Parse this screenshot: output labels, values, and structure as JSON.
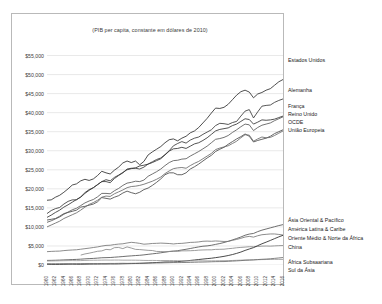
{
  "chart_data": {
    "type": "line",
    "title": "(PIB per capita, constante em dólares de 2010)",
    "xlabel": "",
    "ylabel": "",
    "ylim": [
      0,
      57500
    ],
    "xlim": [
      1960,
      2016
    ],
    "grid": true,
    "legend_position": "right-inline",
    "y_ticks": [
      {
        "value": 55000,
        "label": "$55,000"
      },
      {
        "value": 50000,
        "label": "$50,000"
      },
      {
        "value": 45000,
        "label": "$45,000"
      },
      {
        "value": 40000,
        "label": "$40,000"
      },
      {
        "value": 35000,
        "label": "$35,000"
      },
      {
        "value": 30000,
        "label": "$30,000"
      },
      {
        "value": 25000,
        "label": "$25,000"
      },
      {
        "value": 20000,
        "label": "$20,000"
      },
      {
        "value": 15000,
        "label": "$15,000"
      },
      {
        "value": 10000,
        "label": "$10,000"
      },
      {
        "value": 5000,
        "label": "$5,000"
      },
      {
        "value": 0,
        "label": "$0"
      }
    ],
    "x_ticks": [
      "1960",
      "1962",
      "1964",
      "1966",
      "1968",
      "1970",
      "1972",
      "1974",
      "1976",
      "1978",
      "1980",
      "1982",
      "1984",
      "1986",
      "1988",
      "1990",
      "1992",
      "1994",
      "1996",
      "1998",
      "2000",
      "2002",
      "2004",
      "2006",
      "2008",
      "2010",
      "2012",
      "2014",
      "2016"
    ],
    "x": [
      1960,
      1961,
      1962,
      1963,
      1964,
      1965,
      1966,
      1967,
      1968,
      1969,
      1970,
      1971,
      1972,
      1973,
      1974,
      1975,
      1976,
      1977,
      1978,
      1979,
      1980,
      1981,
      1982,
      1983,
      1984,
      1985,
      1986,
      1987,
      1988,
      1989,
      1990,
      1991,
      1992,
      1993,
      1994,
      1995,
      1996,
      1997,
      1998,
      1999,
      2000,
      2001,
      2002,
      2003,
      2004,
      2005,
      2006,
      2007,
      2008,
      2009,
      2010,
      2011,
      2012,
      2013,
      2014,
      2015,
      2016
    ],
    "series": [
      {
        "name": "Estados Unidos",
        "label": "Estados Unidos",
        "color": "#2f2f2f",
        "values": [
          17000,
          17100,
          17800,
          18300,
          19100,
          20000,
          21000,
          21300,
          22100,
          22500,
          22200,
          22600,
          23500,
          24600,
          24200,
          23900,
          24900,
          25700,
          26800,
          27300,
          26900,
          27300,
          26300,
          27200,
          28900,
          29700,
          30400,
          31100,
          32100,
          32900,
          33100,
          32600,
          33300,
          33800,
          34700,
          35200,
          36100,
          37300,
          38500,
          39900,
          41200,
          41100,
          41400,
          42200,
          43400,
          44600,
          45500,
          45900,
          45400,
          43900,
          44900,
          45300,
          45900,
          46300,
          47200,
          48100,
          48700
        ]
      },
      {
        "name": "Alemanha",
        "label": "Alemanha",
        "color": "#3a3a3a",
        "values": [
          13500,
          14300,
          14800,
          15100,
          16000,
          16700,
          17100,
          17100,
          17900,
          19000,
          19800,
          20300,
          21100,
          21900,
          21900,
          21600,
          22700,
          23500,
          24200,
          25200,
          25400,
          25400,
          25200,
          25700,
          26500,
          27100,
          27700,
          28100,
          29000,
          30000,
          31300,
          31900,
          32400,
          32000,
          32800,
          33300,
          33600,
          34300,
          34900,
          35500,
          36600,
          37200,
          37100,
          36900,
          37400,
          37700,
          39100,
          40400,
          40800,
          38600,
          40200,
          41700,
          41900,
          42000,
          42700,
          43200,
          43600
        ]
      },
      {
        "name": "França",
        "label": "França",
        "color": "#343434",
        "values": [
          12500,
          13100,
          13800,
          14400,
          15200,
          15800,
          16500,
          17200,
          17800,
          18800,
          19600,
          20300,
          21100,
          21900,
          22400,
          22100,
          23000,
          23600,
          24300,
          25000,
          25300,
          25500,
          26000,
          26200,
          26500,
          26900,
          27400,
          27900,
          28900,
          29900,
          30500,
          30600,
          30900,
          30600,
          31200,
          31800,
          32100,
          32700,
          33400,
          34300,
          35200,
          35600,
          35800,
          36000,
          36600,
          37000,
          37700,
          38400,
          38200,
          37000,
          37500,
          38100,
          38000,
          38100,
          38300,
          38700,
          39100
        ]
      },
      {
        "name": "Reino Unido",
        "label": "Reino Unido",
        "color": "#4a4a4a",
        "values": [
          11800,
          12000,
          12200,
          12800,
          13500,
          13800,
          14100,
          14400,
          15200,
          15400,
          15700,
          16000,
          16600,
          17700,
          17500,
          17300,
          17800,
          18200,
          18900,
          19400,
          19000,
          18700,
          19100,
          19800,
          20200,
          20900,
          21700,
          22600,
          23700,
          24200,
          24200,
          23700,
          23700,
          24200,
          25200,
          25800,
          26500,
          27300,
          28100,
          28800,
          29800,
          30400,
          30900,
          31700,
          32400,
          33100,
          33700,
          34400,
          33800,
          32300,
          32700,
          33000,
          33300,
          33800,
          34500,
          35000,
          35500
        ]
      },
      {
        "name": "OCDE",
        "label": "OCDE",
        "color": "#5a5a5a",
        "values": [
          11200,
          11600,
          12100,
          12600,
          13300,
          13900,
          14500,
          14900,
          15600,
          16300,
          16800,
          17200,
          17900,
          18800,
          18800,
          18700,
          19500,
          20100,
          20900,
          21500,
          21700,
          22000,
          21900,
          22300,
          23300,
          23900,
          24500,
          25200,
          26100,
          26900,
          27400,
          27500,
          27800,
          27900,
          28600,
          29200,
          29800,
          30500,
          31200,
          32100,
          33000,
          33200,
          33500,
          34000,
          34800,
          35500,
          36300,
          37000,
          36800,
          35300,
          36100,
          36700,
          37000,
          37300,
          37900,
          38400,
          38900
        ]
      },
      {
        "name": "União Europeia",
        "label": "União Europeia",
        "color": "#6a6a6a",
        "values": [
          10000,
          10500,
          11000,
          11500,
          12200,
          12700,
          13200,
          13700,
          14400,
          15200,
          15900,
          16400,
          17000,
          17800,
          18100,
          18000,
          18700,
          19200,
          19700,
          20300,
          20600,
          20700,
          20900,
          21200,
          21600,
          22000,
          22500,
          23100,
          24000,
          24700,
          25300,
          25500,
          25600,
          25400,
          26100,
          26700,
          27200,
          27900,
          28600,
          29300,
          30300,
          30700,
          31000,
          31300,
          31900,
          32500,
          33400,
          34200,
          34100,
          32500,
          33100,
          33600,
          33400,
          33500,
          34000,
          34600,
          35200
        ]
      },
      {
        "name": "Ásia Oriental & Pacífico",
        "label": "Ásia Oriental & Pacífico",
        "color": "#555555",
        "values": [
          1200,
          1220,
          1250,
          1290,
          1340,
          1380,
          1430,
          1470,
          1530,
          1610,
          1680,
          1730,
          1810,
          1900,
          1930,
          1970,
          2050,
          2130,
          2220,
          2320,
          2400,
          2480,
          2550,
          2660,
          2800,
          2930,
          3050,
          3200,
          3380,
          3530,
          3620,
          3760,
          3950,
          4130,
          4330,
          4550,
          4750,
          4930,
          5020,
          5180,
          5410,
          5630,
          5900,
          6220,
          6580,
          6950,
          7350,
          7820,
          8120,
          8280,
          8760,
          9150,
          9450,
          9750,
          10050,
          10350,
          10600
        ]
      },
      {
        "name": "América Latina & Caribe",
        "label": "América Latina & Caribe",
        "color": "#777777",
        "values": [
          3500,
          3570,
          3620,
          3650,
          3780,
          3870,
          3940,
          4000,
          4140,
          4290,
          4430,
          4590,
          4750,
          4970,
          5140,
          5190,
          5370,
          5490,
          5570,
          5780,
          5950,
          5840,
          5680,
          5460,
          5540,
          5650,
          5690,
          5750,
          5700,
          5640,
          5530,
          5640,
          5680,
          5790,
          5930,
          5970,
          6060,
          6230,
          6270,
          6230,
          6310,
          6250,
          6180,
          6200,
          6480,
          6720,
          7010,
          7340,
          7520,
          7320,
          7680,
          7950,
          8050,
          8150,
          8150,
          8020,
          7870
        ]
      },
      {
        "name": "Oriente Médio & Norte da África",
        "label": "Oriente Médio & Norte da África",
        "color": "#8a8a8a",
        "values": [
          null,
          null,
          null,
          null,
          null,
          null,
          null,
          null,
          2600,
          2900,
          3100,
          3350,
          3600,
          3700,
          4100,
          4000,
          4550,
          4600,
          4300,
          4750,
          4450,
          4100,
          4050,
          3950,
          3850,
          3800,
          3560,
          3540,
          3480,
          3560,
          3660,
          3560,
          3720,
          3720,
          3750,
          3800,
          3900,
          3950,
          3980,
          3980,
          4100,
          4120,
          4150,
          4280,
          4380,
          4520,
          4620,
          4700,
          4800,
          4780,
          4870,
          4950,
          4980,
          4950,
          5020,
          5080,
          5120
        ]
      },
      {
        "name": "China",
        "label": "China",
        "color": "#2a2a2a",
        "values": [
          190,
          160,
          155,
          165,
          185,
          205,
          215,
          195,
          190,
          210,
          235,
          245,
          250,
          265,
          265,
          285,
          275,
          295,
          325,
          350,
          375,
          395,
          425,
          465,
          535,
          605,
          650,
          715,
          790,
          800,
          815,
          875,
          990,
          1090,
          1200,
          1320,
          1440,
          1560,
          1670,
          1780,
          1930,
          2090,
          2270,
          2490,
          2740,
          3050,
          3400,
          3830,
          4200,
          4560,
          5080,
          5570,
          6000,
          6450,
          6920,
          7380,
          7800
        ]
      },
      {
        "name": "África Subsaariana",
        "label": "África Subsaariana",
        "color": "#9a9a9a",
        "values": [
          1050,
          1060,
          1080,
          1110,
          1120,
          1150,
          1160,
          1140,
          1160,
          1200,
          1240,
          1250,
          1260,
          1280,
          1300,
          1280,
          1300,
          1300,
          1270,
          1270,
          1270,
          1260,
          1240,
          1200,
          1190,
          1200,
          1180,
          1170,
          1180,
          1180,
          1160,
          1140,
          1100,
          1080,
          1070,
          1070,
          1080,
          1090,
          1090,
          1090,
          1100,
          1120,
          1130,
          1150,
          1190,
          1230,
          1270,
          1320,
          1360,
          1360,
          1390,
          1420,
          1440,
          1460,
          1480,
          1480,
          1470
        ]
      },
      {
        "name": "Sul da Ásia",
        "label": "Sul da Ásia",
        "color": "#6f6f6f",
        "values": [
          330,
          330,
          335,
          345,
          360,
          355,
          350,
          365,
          370,
          385,
          395,
          390,
          385,
          395,
          395,
          410,
          405,
          430,
          445,
          420,
          440,
          455,
          465,
          485,
          495,
          510,
          530,
          540,
          580,
          605,
          635,
          630,
          650,
          665,
          690,
          720,
          755,
          775,
          805,
          845,
          880,
          895,
          905,
          960,
          1020,
          1080,
          1150,
          1230,
          1270,
          1340,
          1430,
          1500,
          1560,
          1640,
          1740,
          1850,
          1960
        ]
      }
    ]
  },
  "series_label_positions": [
    {
      "label": "Estados Unidos",
      "top": 60
    },
    {
      "label": "Alemanha",
      "top": 90
    },
    {
      "label": "França",
      "top": 106
    },
    {
      "label": "Reino Unido",
      "top": 114
    },
    {
      "label": "OCDE",
      "top": 122
    },
    {
      "label": "União Europeia",
      "top": 130
    },
    {
      "label": "Ásia Oriental & Pacífico",
      "top": 220
    },
    {
      "label": "América Latina & Caribe",
      "top": 229
    },
    {
      "label": "Oriente Médio & Norte da África",
      "top": 238
    },
    {
      "label": "China",
      "top": 247
    },
    {
      "label": "África Subsaariana",
      "top": 262
    },
    {
      "label": "Sul da Ásia",
      "top": 270
    }
  ]
}
